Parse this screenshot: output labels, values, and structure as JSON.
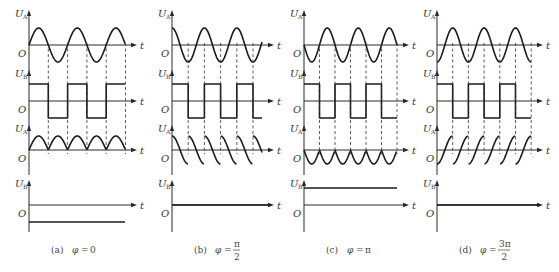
{
  "figure": {
    "axis_labels": {
      "UA": "U",
      "UA_sub": "A",
      "UB": "U",
      "UB_sub": "B",
      "origin": "O",
      "time": "t"
    },
    "panels": [
      {
        "id": "a",
        "caption_prefix": "(a)",
        "caption_var": "φ",
        "caption_eq": "=",
        "caption_value": "0",
        "caption_num": "",
        "caption_den": "",
        "phase": "0",
        "axis_x": 29,
        "x_end": 125,
        "half_period": 19.3,
        "ua_wave": "sine",
        "square_start": "high",
        "product_wave": "positive-full-wave-rectified",
        "ub_dc": "negative"
      },
      {
        "id": "b",
        "caption_prefix": "(b)",
        "caption_var": "φ",
        "caption_eq": "=",
        "caption_value": "",
        "caption_num": "π",
        "caption_den": "2",
        "phase": "π/2",
        "axis_x": 172,
        "x_end": 262,
        "half_period": 16.2,
        "ua_wave": "cosine",
        "square_start": "high",
        "product_wave": "falling-sawtooth-cosine-segments",
        "ub_dc": "zero"
      },
      {
        "id": "c",
        "caption_prefix": "(c)",
        "caption_var": "φ",
        "caption_eq": "=",
        "caption_value": "π",
        "caption_num": "",
        "caption_den": "",
        "phase": "π",
        "axis_x": 304,
        "x_end": 397,
        "half_period": 15.5,
        "ua_wave": "negative-sine",
        "square_start": "high",
        "product_wave": "negative-full-wave-rectified",
        "ub_dc": "positive"
      },
      {
        "id": "d",
        "caption_prefix": "(d)",
        "caption_var": "φ",
        "caption_eq": "=",
        "caption_value": "",
        "caption_num": "3π",
        "caption_den": "2",
        "phase": "3π/2",
        "axis_x": 437,
        "x_end": 531,
        "half_period": 15.7,
        "ua_wave": "negative-cosine",
        "square_start": "high",
        "product_wave": "rising-sawtooth-cosine-segments",
        "ub_dc": "zero"
      }
    ],
    "rows": {
      "ua": {
        "baseline_y": 45,
        "amplitude": 17,
        "axis_top": 10,
        "axis_bottom": 72
      },
      "ub": {
        "baseline_y": 101,
        "amplitude": 17,
        "axis_top": 70,
        "axis_bottom": 128
      },
      "prod": {
        "baseline_y": 150,
        "amplitude": 14,
        "axis_top": 125,
        "axis_bottom": 175
      },
      "dc": {
        "baseline_y": 205,
        "level": 17,
        "axis_top": 180,
        "axis_bottom": 232
      }
    },
    "caption_y": 250,
    "colors": {
      "line": "#1a1a1a",
      "axis": "#2a2a2a",
      "text": "#444444",
      "background": "#ffffff"
    }
  }
}
